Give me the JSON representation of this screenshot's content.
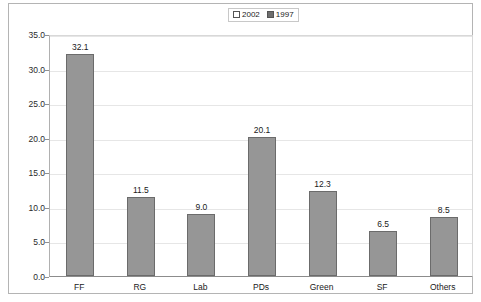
{
  "chart_data": {
    "type": "bar",
    "title": "",
    "xlabel": "",
    "ylabel": "",
    "categories": [
      "FF",
      "RG",
      "Lab",
      "PDs",
      "Green",
      "SF",
      "Others"
    ],
    "values": [
      32.1,
      11.5,
      9.0,
      20.1,
      12.3,
      6.5,
      8.5
    ],
    "value_labels": [
      "32.1",
      "11.5",
      "9.0",
      "20.1",
      "12.3",
      "6.5",
      "8.5"
    ],
    "series": [
      {
        "name": "1997",
        "values": [
          32.1,
          11.5,
          9.0,
          20.1,
          12.3,
          6.5,
          8.5
        ]
      }
    ],
    "ylim": [
      0.0,
      35.0
    ],
    "ytick_step": 5.0,
    "ytick_labels": [
      "35.0",
      "30.0",
      "25.0",
      "20.0",
      "15.0",
      "10.0",
      "5.0",
      "0.0"
    ],
    "ytick_values": [
      35.0,
      30.0,
      25.0,
      20.0,
      15.0,
      10.0,
      5.0,
      0.0
    ],
    "grid": true,
    "legend_position": "top-center"
  },
  "legend": {
    "entries": [
      {
        "label": "2002",
        "swatch": "light",
        "color": "#ffffff"
      },
      {
        "label": "1997",
        "swatch": "dark",
        "color": "#6e6e6e"
      }
    ]
  },
  "colors": {
    "bar_fill": "#969696",
    "bar_border": "#6b6b6b",
    "gridline": "#e6e6e6",
    "frame": "#b4b4b4",
    "axis": "#8c8c8c",
    "text": "#1a1a1a"
  }
}
